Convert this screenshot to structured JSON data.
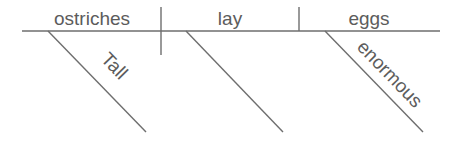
{
  "diagram": {
    "type": "sentence-diagram",
    "sentence": "Tall ostriches lay enormous eggs",
    "subject": "ostriches",
    "verb": "lay",
    "direct_object": "eggs",
    "modifiers": [
      {
        "word": "Tall",
        "modifies": "ostriches"
      },
      {
        "word": "",
        "modifies": "lay"
      },
      {
        "word": "enormous",
        "modifies": "eggs"
      }
    ],
    "colors": {
      "line": "#6e6e6e",
      "text": "#5c5c5c",
      "background": "#ffffff"
    }
  }
}
